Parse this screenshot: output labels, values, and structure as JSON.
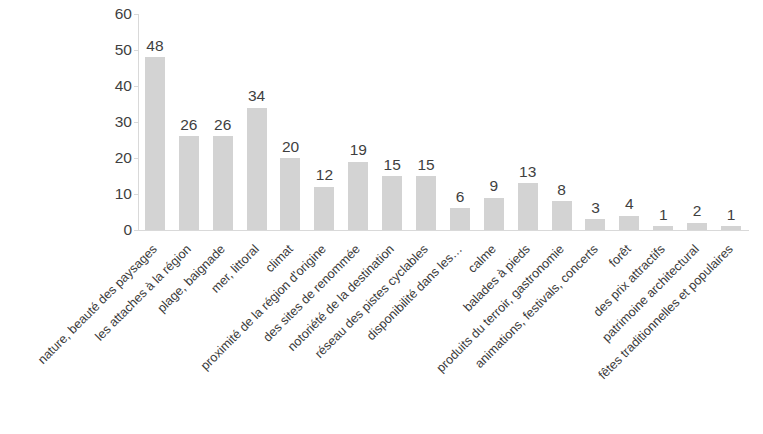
{
  "chart_data": {
    "type": "bar",
    "title": "",
    "subtitle": "",
    "xlabel": "",
    "ylabel": "",
    "ylim": [
      0,
      60
    ],
    "yticks": [
      0,
      10,
      20,
      30,
      40,
      50,
      60
    ],
    "grid": false,
    "legend": null,
    "bar_color": "#d3d3d3",
    "text_color": "#3f3f3f",
    "axis_color": "#d9d9d9",
    "show_value_labels": true,
    "categories": [
      "nature, beauté des paysages",
      "les attaches à la région",
      "plage, baignade",
      "mer, littoral",
      "climat",
      "proximité de la région d'origine",
      "des sites de renommée",
      "notoriété de la destination",
      "réseau des pistes cyclables",
      "disponibilité dans les…",
      "calme",
      "balades à pieds",
      "produits du terroir, gastronomie",
      "animations, festivals, concerts",
      "forêt",
      "des prix attractifs",
      "patrimoine architectural",
      "fêtes traditionnelles et populaires"
    ],
    "values": [
      48,
      26,
      26,
      34,
      20,
      12,
      19,
      15,
      15,
      6,
      9,
      13,
      8,
      3,
      4,
      1,
      2,
      1
    ]
  }
}
